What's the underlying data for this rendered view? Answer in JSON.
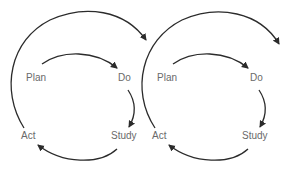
{
  "diagram": {
    "colors": {
      "stroke": "#2b2b2b",
      "label": "#6a6a6a",
      "background": "#ffffff"
    },
    "cycles": [
      {
        "id": "cycle-1",
        "stages": {
          "plan": "Plan",
          "do": "Do",
          "study": "Study",
          "act": "Act"
        }
      },
      {
        "id": "cycle-2",
        "stages": {
          "plan": "Plan",
          "do": "Do",
          "study": "Study",
          "act": "Act"
        }
      }
    ],
    "flow": [
      "Plan → Do",
      "Do → Study",
      "Study → Act",
      "Act → next cycle"
    ]
  }
}
